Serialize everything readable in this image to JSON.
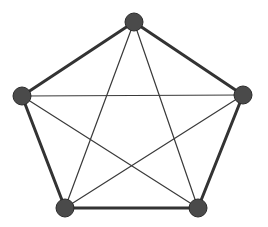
{
  "figure": {
    "background_color": "#ffffff",
    "width": 268,
    "height": 227
  },
  "style": {
    "node_fill": "#4a4a4a",
    "node_stroke": "#2b2b2b",
    "node_stroke_width": 1,
    "node_radius": 9,
    "outer_edge_color": "#333333",
    "outer_edge_width": 3,
    "inner_edge_color": "#3a3a3a",
    "inner_edge_width": 1.2
  },
  "chart_data": {
    "type": "diagram",
    "graph_type": "complete-graph",
    "name": "K5",
    "vertex_count": 5,
    "edge_count": 10,
    "degree": 4,
    "layout": "regular-pentagon",
    "xlim": [
      0,
      268
    ],
    "ylim": [
      0,
      227
    ],
    "grid": false,
    "legend": false,
    "nodes": [
      {
        "id": "v1",
        "label": "",
        "position": "top",
        "x": 134,
        "y": 22
      },
      {
        "id": "v2",
        "label": "",
        "position": "left",
        "x": 22,
        "y": 96
      },
      {
        "id": "v3",
        "label": "",
        "position": "right",
        "x": 243,
        "y": 95
      },
      {
        "id": "v4",
        "label": "",
        "position": "bottom-left",
        "x": 65,
        "y": 208
      },
      {
        "id": "v5",
        "label": "",
        "position": "bottom-right",
        "x": 198,
        "y": 208
      }
    ],
    "edges": [
      {
        "from": "v1",
        "to": "v2",
        "kind": "outer"
      },
      {
        "from": "v1",
        "to": "v3",
        "kind": "outer"
      },
      {
        "from": "v2",
        "to": "v4",
        "kind": "outer"
      },
      {
        "from": "v3",
        "to": "v5",
        "kind": "outer"
      },
      {
        "from": "v4",
        "to": "v5",
        "kind": "outer"
      },
      {
        "from": "v1",
        "to": "v4",
        "kind": "inner"
      },
      {
        "from": "v1",
        "to": "v5",
        "kind": "inner"
      },
      {
        "from": "v2",
        "to": "v3",
        "kind": "inner"
      },
      {
        "from": "v2",
        "to": "v5",
        "kind": "inner"
      },
      {
        "from": "v3",
        "to": "v4",
        "kind": "inner"
      }
    ]
  }
}
